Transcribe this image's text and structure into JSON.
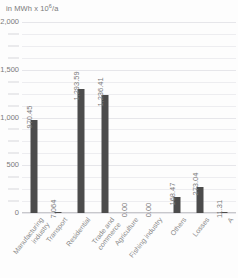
{
  "chart_data": {
    "type": "bar",
    "title": "",
    "subtitle": "",
    "unit_caption": "in MWh x 10",
    "unit_exponent": "6",
    "unit_suffix": "/a",
    "xlabel": "",
    "ylabel": "",
    "ylim": [
      0,
      2000
    ],
    "grid": true,
    "legend": false,
    "major_ticks": [
      "2,000",
      "1,500",
      "1,000",
      "500",
      "0"
    ],
    "major_tick_values": [
      2000,
      1500,
      1000,
      500,
      0
    ],
    "minor_tick_step": 125,
    "categories": [
      "Manufacturing\nindustry",
      "Transport",
      "Residential",
      "Trade and\ncommerce",
      "Agriculture",
      "Fishing industry",
      "Others",
      "Losses",
      "A"
    ],
    "values": [
      970.45,
      7.064,
      1293.59,
      1236.41,
      0.0,
      0.0,
      168.47,
      273.04,
      11.31
    ],
    "value_labels": [
      "970.45",
      "7.064",
      "1,293.59",
      "1,236.41",
      "0.00",
      "0.00",
      "168.47",
      "273.04",
      "11.31"
    ],
    "colors": {
      "bar": "#4c4c4c",
      "gridline": "#ededf0",
      "gridline_major": "#e6e6ea",
      "axis": "#c8c8cc",
      "text": "#7a7a7a",
      "background": "#fdfdfd"
    }
  }
}
